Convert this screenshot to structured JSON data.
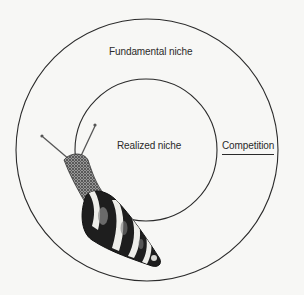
{
  "diagram": {
    "type": "concentric-niche-diagram",
    "background": "#f7f7f5",
    "line_color": "#2a2a2a",
    "outer_circle": {
      "label": "Fundamental niche",
      "cx": 147,
      "cy": 150,
      "r": 131
    },
    "inner_circle": {
      "label": "Realized niche",
      "cx": 146,
      "cy": 150,
      "r": 71
    },
    "annotation": {
      "label": "Competition",
      "underlined": true
    },
    "illustration": {
      "subject": "snail",
      "description": "Banded tree snail crawling across both circles, head at upper-left with two tentacles, shell spire pointing lower-right"
    }
  }
}
